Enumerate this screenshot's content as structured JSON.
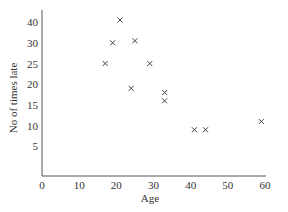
{
  "chart_data": {
    "type": "scatter",
    "title": "",
    "xlabel": "Age",
    "ylabel": "No of times late",
    "xlim": [
      0,
      60
    ],
    "x_ticks": [
      0,
      10,
      20,
      30,
      40,
      50,
      60
    ],
    "y_tick_labels": [
      "5",
      "10",
      "15",
      "20",
      "25",
      "30",
      "40"
    ],
    "y_tick_positions": [
      5,
      10,
      15,
      20,
      25,
      30,
      35
    ],
    "ylim": [
      0,
      40
    ],
    "grid": false,
    "legend": null,
    "marker": "x",
    "series": [
      {
        "name": "Lateness vs Age",
        "points": [
          {
            "x": 21,
            "y": 41
          },
          {
            "x": 19,
            "y": 30
          },
          {
            "x": 25,
            "y": 31
          },
          {
            "x": 17,
            "y": 25
          },
          {
            "x": 29,
            "y": 25
          },
          {
            "x": 24,
            "y": 19
          },
          {
            "x": 33,
            "y": 18
          },
          {
            "x": 33,
            "y": 16
          },
          {
            "x": 41,
            "y": 9
          },
          {
            "x": 44,
            "y": 9
          },
          {
            "x": 59,
            "y": 11
          }
        ]
      }
    ]
  },
  "labels": {
    "x_axis": "Age",
    "y_axis": "No of times late"
  }
}
